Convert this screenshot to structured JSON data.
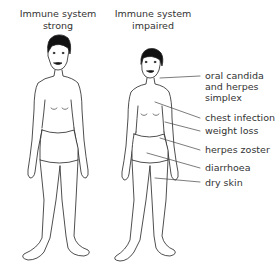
{
  "figures": {
    "strong": {
      "title_line1": "Immune system",
      "title_line2": "strong"
    },
    "impaired": {
      "title_line1": "Immune system",
      "title_line2": "impaired"
    }
  },
  "labels": [
    {
      "line1": "oral candida",
      "line2": "and herpes",
      "line3": "simplex"
    },
    {
      "line1": "chest infection"
    },
    {
      "line1": "weight loss"
    },
    {
      "line1": "herpes zoster"
    },
    {
      "line1": "diarrhoea"
    },
    {
      "line1": "dry skin"
    }
  ]
}
